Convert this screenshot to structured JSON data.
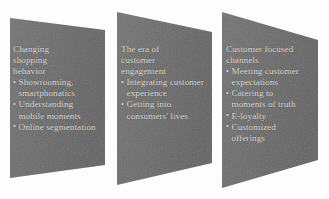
{
  "diagram": {
    "type": "three-stage-arrow-diagram",
    "background_color": "#fdfdfd",
    "panel_fill_color": "#6b6b6b",
    "panel_text_color": "#ded9d2",
    "bullet_glyph": "•",
    "panels": [
      {
        "id": "panel-1",
        "heading": "Changing\nshopping\nbehavior",
        "bullets": [
          "Showrooming,\nsmartphonatics",
          "Understanding\nmobile moments",
          "Online segmentation"
        ]
      },
      {
        "id": "panel-2",
        "heading": "The era of\ncustomer\nengagement",
        "bullets": [
          "Integrating customer\nexperience",
          "Getting into\nconsumers' lives"
        ]
      },
      {
        "id": "panel-3",
        "heading": "Customer focused\nchannels",
        "bullets": [
          "Meeting customer\nexpectations",
          "Catering to\nmoments of truth",
          "E-loyalty",
          "Customized\nofferings"
        ]
      }
    ]
  }
}
